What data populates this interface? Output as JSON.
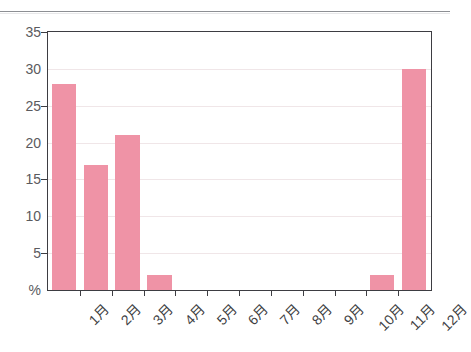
{
  "chart_data": {
    "type": "bar",
    "title": "",
    "subtitle": "",
    "xlabel": "",
    "ylabel": "%",
    "categories": [
      "1月",
      "2月",
      "3月",
      "4月",
      "5月",
      "6月",
      "7月",
      "8月",
      "9月",
      "10月",
      "11月",
      "12月"
    ],
    "values": [
      28,
      17,
      21,
      2,
      0,
      0,
      0,
      0,
      0,
      0,
      2,
      30
    ],
    "ylim": [
      0,
      35
    ],
    "ytick_labels": [
      "%",
      "5",
      "10",
      "15",
      "20",
      "25",
      "30",
      "35"
    ],
    "ytick_values": [
      0,
      5,
      10,
      15,
      20,
      25,
      30,
      35
    ],
    "grid": true,
    "legend": "none",
    "series": [
      {
        "name": "",
        "color": "#ef93a6",
        "values": [
          28,
          17,
          21,
          2,
          0,
          0,
          0,
          0,
          0,
          0,
          2,
          30
        ]
      }
    ],
    "annotations": []
  },
  "colors": {
    "bar": "#ef93a6",
    "axis": "#3d3d42",
    "gridline": "#f0e6e8",
    "tick_text": "#5a5a5e",
    "label_text": "#3f3f44",
    "rule": "#8d8f94",
    "background": "#ffffff"
  }
}
